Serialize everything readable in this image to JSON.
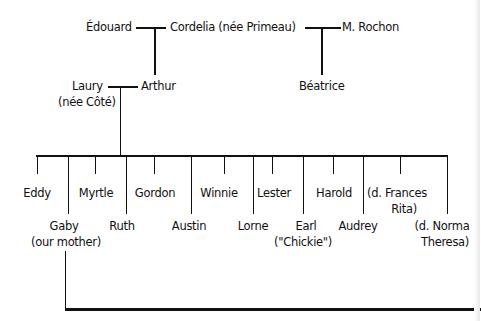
{
  "diagram": {
    "type": "family-tree",
    "generation1": {
      "left_couple": {
        "husband": "Édouard",
        "wife": "Cordelia (née Primeau)"
      },
      "right_partner": "M. Rochon"
    },
    "generation2": {
      "arthur_spouse_line1": "Laury",
      "arthur_spouse_line2": "(née Côté)",
      "arthur": "Arthur",
      "beatrice": "Béatrice"
    },
    "children": [
      {
        "name": "Eddy"
      },
      {
        "name": "Gaby",
        "note": "(our mother)"
      },
      {
        "name": "Myrtle"
      },
      {
        "name": "Ruth"
      },
      {
        "name": "Gordon"
      },
      {
        "name": "Austin"
      },
      {
        "name": "Winnie"
      },
      {
        "name": "Lorne"
      },
      {
        "name": "Lester"
      },
      {
        "name": "Earl",
        "note": "(\"Chickie\")"
      },
      {
        "name": "Harold"
      },
      {
        "name": "Audrey"
      },
      {
        "name": "(d. Frances",
        "note": "Rita)"
      },
      {
        "name": "(d. Norma",
        "note": "Theresa)"
      }
    ],
    "line_color": "#111111"
  }
}
